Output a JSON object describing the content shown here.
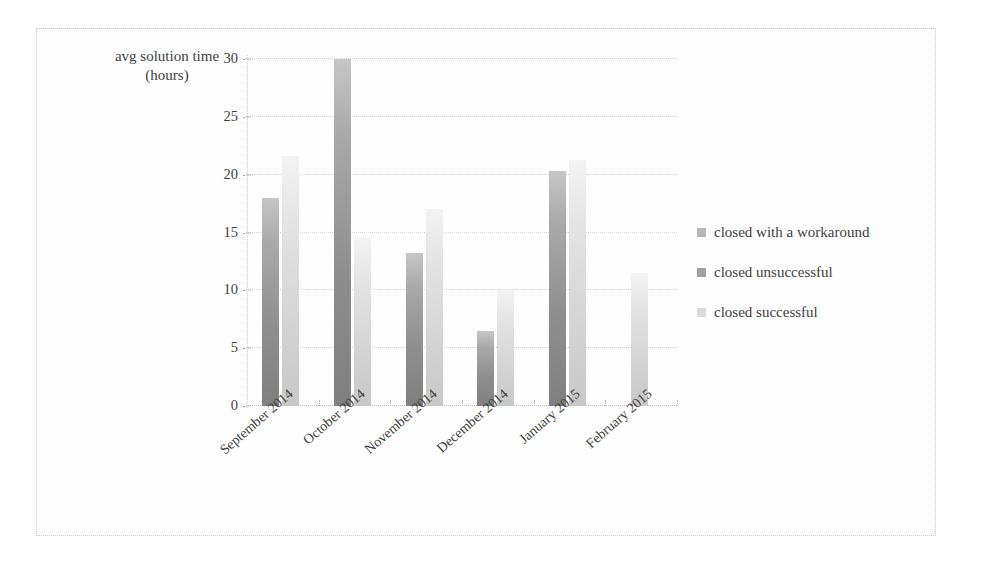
{
  "chart_data": {
    "type": "bar",
    "title": "",
    "ylabel": "avg solution time\n(hours)",
    "xlabel": "",
    "ylim": [
      0,
      30
    ],
    "yticks": [
      0,
      5,
      10,
      15,
      20,
      25,
      30
    ],
    "ytick_labels": [
      "0",
      "5",
      "10",
      "15",
      "20",
      "25",
      "30"
    ],
    "grid": true,
    "legend_position": "right",
    "categories": [
      "September 2014",
      "October 2014",
      "November 2014",
      "December 2014",
      "January 2015",
      "February 2015"
    ],
    "series": [
      {
        "name": "closed with a workaround",
        "color": "#b6b6b6",
        "values": [
          0,
          0,
          0,
          0,
          0,
          0
        ]
      },
      {
        "name": "closed unsuccessful",
        "color": "#a0a0a0",
        "values": [
          18.0,
          30.0,
          13.2,
          6.5,
          20.3,
          0
        ]
      },
      {
        "name": "closed successful",
        "color": "#dcdcdc",
        "values": [
          21.6,
          14.5,
          17.0,
          10.0,
          21.3,
          11.5
        ]
      }
    ]
  }
}
